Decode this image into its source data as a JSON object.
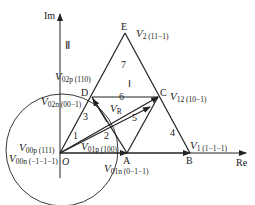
{
  "axes": {
    "im_label": "Im",
    "re_label": "Re",
    "quadrant_label": "Ⅱ"
  },
  "points": {
    "O": "O",
    "A": "A",
    "B": "B",
    "C": "C",
    "D": "D",
    "E": "E"
  },
  "vectors": [
    {
      "name": "V",
      "sub": "2 (11−1)"
    },
    {
      "name": "V",
      "sub": "12 (10−1)"
    },
    {
      "name": "V",
      "sub": "1 (1−1−1)"
    },
    {
      "name": "V",
      "sub": "02p (110)"
    },
    {
      "name": "V",
      "sub": "02n (00−1)"
    },
    {
      "name": "V",
      "sub": "00p (111)"
    },
    {
      "name": "V",
      "sub": "00n (−1−1−1)"
    },
    {
      "name": "V",
      "sub": "01p (100)"
    },
    {
      "name": "V",
      "sub": "01n (0−1−1)"
    },
    {
      "name": "V",
      "sub": "R"
    }
  ],
  "regions": [
    "1",
    "2",
    "3",
    "4",
    "5",
    "6",
    "7",
    "Ⅰ"
  ],
  "colors": {
    "line": "#222222",
    "background": "#ffffff"
  }
}
